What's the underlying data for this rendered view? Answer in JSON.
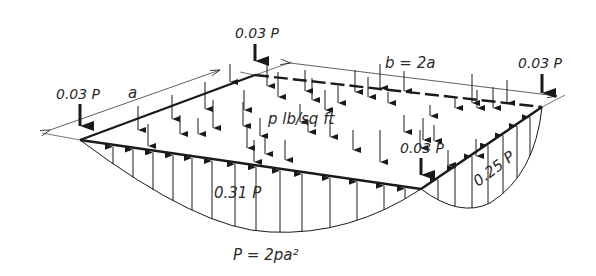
{
  "labels": {
    "corner_left": "0.03 P",
    "corner_back": "0.03 P",
    "corner_right": "0.03 P",
    "corner_front": "0.03 P",
    "dim_a": "a",
    "dim_b": "b = 2a",
    "load": "p lb/sq ft",
    "reaction_long_edge": "0.31 P",
    "reaction_short_edge": "0.25 P",
    "formula": "P = 2pa²"
  },
  "colors": {
    "ink": "#1a1a1a",
    "background": "#ffffff"
  }
}
